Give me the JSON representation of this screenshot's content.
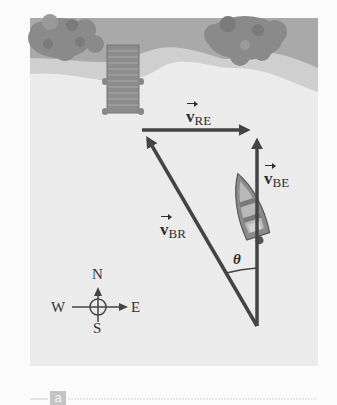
{
  "figure": {
    "panel_label": "a",
    "colors": {
      "water": "#ececec",
      "bank": "#a9a9a9",
      "sand": "#cfcfcf",
      "trees": "#8a8a8a",
      "dock": "#8c8c8c",
      "vector": "#444444",
      "background": "#fbfbfb"
    }
  },
  "vectors": {
    "v_re": {
      "symbol": "v",
      "subscript": "RE",
      "direction": "east"
    },
    "v_be": {
      "symbol": "v",
      "subscript": "BE",
      "direction": "north"
    },
    "v_br": {
      "symbol": "v",
      "subscript": "BR",
      "direction": "northwest"
    }
  },
  "angle": {
    "label": "θ"
  },
  "compass": {
    "north": "N",
    "south": "S",
    "east": "E",
    "west": "W"
  },
  "icons": {
    "boat": "boat-icon",
    "dock": "dock-icon",
    "trees": "tree-icon",
    "compass": "compass-rose-icon"
  }
}
